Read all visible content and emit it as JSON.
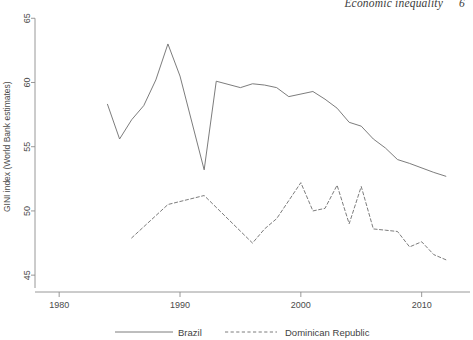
{
  "running_head": {
    "title": "Economic inequality",
    "page_number": "6"
  },
  "chart_data": {
    "type": "line",
    "title": "",
    "xlabel": "",
    "ylabel": "GINI index (World Bank estimates)",
    "xlim": [
      1978,
      1015
    ],
    "xlim_years": [
      1978,
      2014
    ],
    "ylim": [
      44.0,
      65.8
    ],
    "grid": false,
    "legend_position": "bottom",
    "xticks": [
      1980,
      1990,
      2000,
      2010
    ],
    "xtick_labels": [
      "1980",
      "1990",
      "2000",
      "2010"
    ],
    "yticks": [
      45,
      50,
      55,
      60,
      65
    ],
    "ytick_labels": [
      "45",
      "50",
      "55",
      "60",
      "65"
    ],
    "series": [
      {
        "name": "Brazil",
        "style": "solid",
        "color": "#6d6d6d",
        "x": [
          1984,
          1985,
          1986,
          1987,
          1988,
          1989,
          1990,
          1992,
          1993,
          1995,
          1996,
          1997,
          1998,
          1999,
          2001,
          2002,
          2003,
          2004,
          2005,
          2006,
          2007,
          2008,
          2009,
          2011,
          2012
        ],
        "y": [
          58.3,
          55.6,
          57.1,
          58.2,
          60.2,
          63.0,
          60.5,
          53.2,
          60.1,
          59.6,
          59.9,
          59.8,
          59.6,
          58.9,
          59.3,
          58.7,
          58.0,
          56.9,
          56.6,
          55.6,
          54.9,
          54.0,
          53.7,
          53.0,
          52.7
        ]
      },
      {
        "name": "Dominican Republic",
        "style": "dashed",
        "color": "#6d6d6d",
        "x": [
          1986,
          1989,
          1992,
          1996,
          1997,
          1998,
          2000,
          2001,
          2002,
          2003,
          2004,
          2005,
          2006,
          2007,
          2008,
          2009,
          2010,
          2011,
          2012
        ],
        "y": [
          47.9,
          50.5,
          51.2,
          47.5,
          48.6,
          49.4,
          52.2,
          50.0,
          50.2,
          52.0,
          49.0,
          51.9,
          48.6,
          48.5,
          48.4,
          47.2,
          47.6,
          46.6,
          46.2
        ]
      }
    ]
  },
  "legend": {
    "items": [
      {
        "label": "Brazil",
        "style": "solid"
      },
      {
        "label": "Dominican Republic",
        "style": "dashed"
      }
    ]
  }
}
